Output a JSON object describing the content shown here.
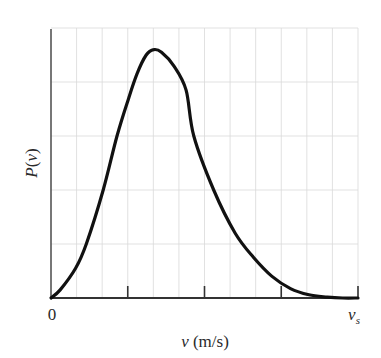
{
  "chart_data": {
    "type": "line",
    "title": "",
    "xlabel": "v (m/s)",
    "ylabel": "P(v)",
    "x_tick_labels": [
      "0",
      "v_s"
    ],
    "x_tick_label_start": "0",
    "x_tick_label_end_main": "v",
    "x_tick_label_end_sub": "s",
    "xlim": [
      0,
      1
    ],
    "ylim": [
      0,
      1
    ],
    "x_ticks_major": [
      0,
      0.25,
      0.5,
      0.75,
      1.0
    ],
    "grid": true,
    "grid_vertical_divisions": 12,
    "grid_horizontal_divisions": 5,
    "legend": null,
    "series": [
      {
        "name": "P(v)",
        "description": "Maxwell-Boltzmann-like speed distribution, peak near x=0.34",
        "x": [
          0.0,
          0.03,
          0.08,
          0.115,
          0.17,
          0.215,
          0.25,
          0.28,
          0.31,
          0.335,
          0.36,
          0.4,
          0.44,
          0.465,
          0.53,
          0.6,
          0.66,
          0.72,
          0.78,
          0.84,
          0.9,
          0.95,
          1.0
        ],
        "y": [
          0.0,
          0.03,
          0.11,
          0.2,
          0.4,
          0.6,
          0.73,
          0.83,
          0.9,
          0.92,
          0.91,
          0.86,
          0.77,
          0.6,
          0.4,
          0.24,
          0.15,
          0.08,
          0.035,
          0.012,
          0.003,
          0.0,
          0.0
        ]
      }
    ]
  },
  "labels": {
    "y_axis": "P(v)",
    "x_axis": "v (m/s)",
    "x_origin": "0",
    "x_end_main": "v",
    "x_end_sub": "s"
  }
}
